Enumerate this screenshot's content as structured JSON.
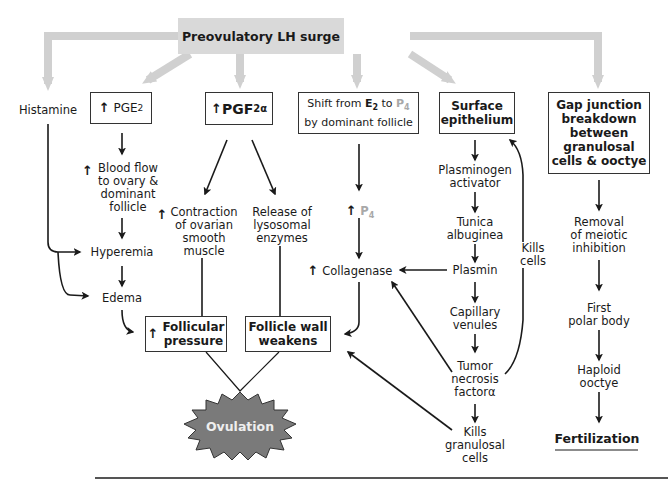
{
  "title": "Preovulatory LH surge",
  "nodes": {
    "histamine": "Histamine",
    "pge2": {
      "arrow": "↑",
      "text": "PGE",
      "sub": "2"
    },
    "pgf2a": {
      "arrow": "↑",
      "text": "PGF",
      "sub": "2α"
    },
    "shift": {
      "line1_a": "Shift from ",
      "e2": "E",
      "e2_sub": "2",
      "line1_b": " to ",
      "p4": "P",
      "p4_sub": "4",
      "line2": "by dominant follicle"
    },
    "surface_epithelium": {
      "line1": "Surface",
      "line2": "epithelium"
    },
    "gap_junction": {
      "line1": "Gap junction",
      "line2": "breakdown",
      "line3": "between",
      "line4": "granulosal",
      "line5": "cells & ooctye"
    },
    "blood_flow": {
      "arrow": "↑",
      "line1": "Blood flow",
      "line2": "to ovary &",
      "line3": "dominant",
      "line4": "follicle"
    },
    "hyperemia": "Hyperemia",
    "edema": "Edema",
    "contraction": {
      "arrow": "↑",
      "line1": "Contraction",
      "line2": "of ovarian",
      "line3": "smooth",
      "line4": "muscle"
    },
    "lysosomal": {
      "line1": "Release of",
      "line2": "lysosomal",
      "line3": "enzymes"
    },
    "p4_up": {
      "arrow": "↑",
      "text": "P",
      "sub": "4"
    },
    "collagenase": {
      "arrow": "↑",
      "text": "Collagenase"
    },
    "plasminogen": {
      "line1": "Plasminogen",
      "line2": "activator"
    },
    "tunica": {
      "line1": "Tunica",
      "line2": "albuginea"
    },
    "plasmin": "Plasmin",
    "capillary": {
      "line1": "Capillary",
      "line2": "venules"
    },
    "tnf": {
      "line1": "Tumor",
      "line2": "necrosis",
      "line3": "factorα"
    },
    "kills_granulosal": {
      "line1": "Kills",
      "line2": "granulosal",
      "line3": "cells"
    },
    "kills_cells": {
      "line1": "Kills",
      "line2": "cells"
    },
    "follicular_pressure": {
      "arrow": "↑",
      "line1": "Follicular",
      "line2": "pressure"
    },
    "follicle_wall": {
      "line1": "Follicle wall",
      "line2": "weakens"
    },
    "ovulation": "Ovulation",
    "meiotic": {
      "line1": "Removal",
      "line2": "of meiotic",
      "line3": "inhibition"
    },
    "polar_body": {
      "line1": "First",
      "line2": "polar body"
    },
    "haploid": {
      "line1": "Haploid",
      "line2": "ooctye"
    },
    "fertilization": "Fertilization"
  },
  "colors": {
    "header_fill": "#d9d9d9",
    "wide_arrow": "#d0d0d0",
    "ovulation_fill": "#7a7a7a",
    "p4_color": "#a8a8a8"
  }
}
